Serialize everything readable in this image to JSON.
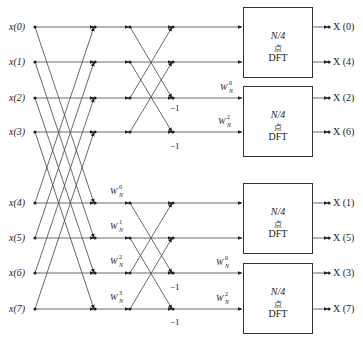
{
  "diagram": {
    "inputs": [
      "x(0)",
      "x(1)",
      "x(2)",
      "x(3)",
      "x(4)",
      "x(5)",
      "x(6)",
      "x(7)"
    ],
    "outputs": [
      "X (0)",
      "X (4)",
      "X (2)",
      "X (6)",
      "X (1)",
      "X (5)",
      "X (3)",
      "X (7)"
    ],
    "stage1_twiddles": [
      {
        "base": "W",
        "sub": "N",
        "sup": "0"
      },
      {
        "base": "W",
        "sub": "N",
        "sup": "1"
      },
      {
        "base": "W",
        "sub": "N",
        "sup": "2"
      },
      {
        "base": "W",
        "sub": "N",
        "sup": "3"
      }
    ],
    "stage2_twiddles": [
      {
        "base": "W",
        "sub": "N",
        "sup": "0"
      },
      {
        "base": "W",
        "sub": "N",
        "sup": "2"
      },
      {
        "base": "W",
        "sub": "N",
        "sup": "0"
      },
      {
        "base": "W",
        "sub": "N",
        "sup": "2"
      }
    ],
    "minus_one": "−1",
    "blocks": [
      {
        "line1": "N/4",
        "line2": "点",
        "line3": "DFT"
      },
      {
        "line1": "N/4",
        "line2": "点",
        "line3": "DFT"
      },
      {
        "line1": "N/4",
        "line2": "点",
        "line3": "DFT"
      },
      {
        "line1": "N/4",
        "line2": "点",
        "line3": "DFT"
      }
    ],
    "colors": {
      "line": "#333333",
      "background": "#ffffff"
    }
  }
}
